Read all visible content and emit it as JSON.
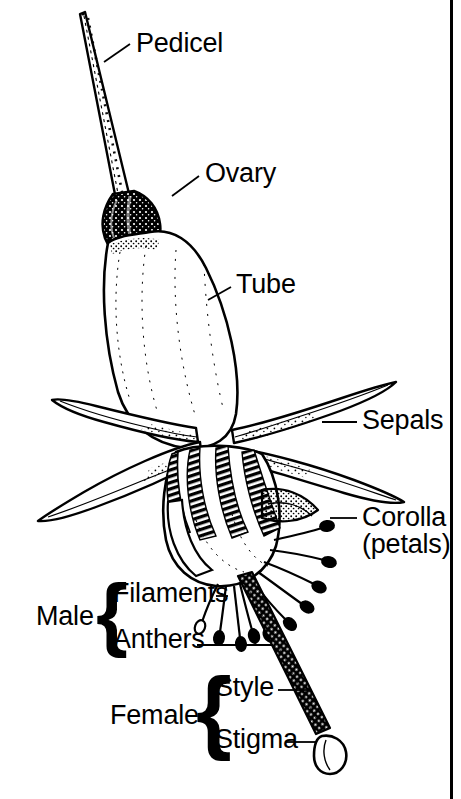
{
  "diagram": {
    "style": "black-and-white-line-drawing",
    "colors": {
      "ink": "#000000",
      "background": "#ffffff",
      "leader_line": "#000000",
      "frame": "#000000"
    },
    "labels": [
      {
        "key": "pedicel",
        "text": "Pedicel",
        "x": 136,
        "y": 30,
        "leader": {
          "x1": 104,
          "y1": 62,
          "x2": 130,
          "y2": 44
        }
      },
      {
        "key": "ovary",
        "text": "Ovary",
        "x": 205,
        "y": 160,
        "leader": {
          "x1": 172,
          "y1": 196,
          "x2": 199,
          "y2": 176
        }
      },
      {
        "key": "tube",
        "text": "Tube",
        "x": 236,
        "y": 271,
        "leader": {
          "x1": 208,
          "y1": 300,
          "x2": 231,
          "y2": 287
        }
      },
      {
        "key": "sepals",
        "text": "Sepals",
        "x": 362,
        "y": 407,
        "leader": {
          "x1": 322,
          "y1": 422,
          "x2": 357,
          "y2": 422
        }
      },
      {
        "key": "corolla",
        "text": "Corolla",
        "x": 362,
        "y": 504,
        "leader": {
          "x1": 330,
          "y1": 518,
          "x2": 357,
          "y2": 518
        }
      },
      {
        "key": "petals",
        "text": "(petals)",
        "x": 362,
        "y": 531,
        "leader": null
      },
      {
        "key": "filaments",
        "text": "Filaments",
        "x": 113,
        "y": 580,
        "leader": {
          "x1": 216,
          "y1": 596,
          "x2": 228,
          "y2": 596
        }
      },
      {
        "key": "anthers",
        "text": "Anthers",
        "x": 113,
        "y": 626,
        "leader": {
          "x1": 197,
          "y1": 645,
          "x2": 273,
          "y2": 645
        }
      },
      {
        "key": "style",
        "text": "Style",
        "x": 215,
        "y": 674,
        "leader": {
          "x1": 278,
          "y1": 690,
          "x2": 310,
          "y2": 690
        }
      },
      {
        "key": "stigma",
        "text": "Stigma",
        "x": 215,
        "y": 726,
        "leader": {
          "x1": 285,
          "y1": 742,
          "x2": 317,
          "y2": 742
        }
      }
    ],
    "groups": [
      {
        "key": "male",
        "text": "Male",
        "x": 36,
        "y": 603,
        "brace": {
          "x": 96,
          "y": 578,
          "height": 70,
          "members": [
            "filaments",
            "anthers"
          ]
        }
      },
      {
        "key": "female",
        "text": "Female",
        "x": 110,
        "y": 702,
        "brace": {
          "x": 196,
          "y": 672,
          "height": 78,
          "members": [
            "style",
            "stigma"
          ]
        }
      }
    ],
    "structures": [
      {
        "key": "pedicel",
        "name": "pedicel-stalk",
        "description": "long slender stalk angling up-left from the ovary"
      },
      {
        "key": "ovary",
        "name": "ovary-body",
        "description": "solid dark swollen bulb below the pedicel"
      },
      {
        "key": "tube",
        "name": "floral-tube",
        "description": "pale elongated tube with stippled shading"
      },
      {
        "key": "sepals",
        "name": "sepal-lobes",
        "description": "four reflexed pointed sepals spreading sideways"
      },
      {
        "key": "corolla",
        "name": "corolla-petals",
        "description": "overlapping petals with dense hatching at the throat"
      },
      {
        "key": "stamens",
        "name": "stamen-cluster",
        "description": "radiating filaments each tipped by a dark anther"
      },
      {
        "key": "style",
        "name": "style-shaft",
        "description": "thick dark textured shaft descending to lower right"
      },
      {
        "key": "stigma",
        "name": "stigma-head",
        "description": "club shaped outlined tip at the end of the style"
      }
    ],
    "frame": {
      "name": "right-border-rule",
      "x": 450,
      "width": 3
    }
  }
}
